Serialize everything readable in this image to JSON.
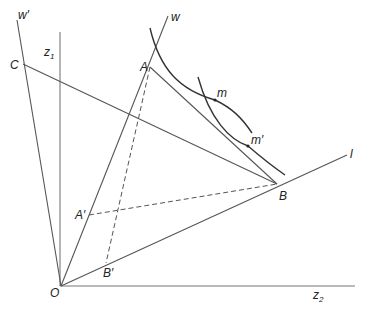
{
  "figure": {
    "type": "geometric diagram",
    "labels": {
      "w_prime": "w′",
      "z1": "z",
      "z1_sub": "1",
      "C": "C",
      "w": "w",
      "A": "A",
      "m": "m",
      "m_prime": "m′",
      "l": "l",
      "B": "B",
      "A_prime": "A′",
      "B_prime": "B′",
      "O": "O",
      "z2": "z",
      "z2_sub": "2"
    },
    "points": {
      "O": [
        61,
        286
      ],
      "A": [
        150,
        67
      ],
      "B": [
        277,
        184
      ],
      "C": [
        23,
        64
      ],
      "A_prime": [
        89,
        215
      ],
      "B_prime": [
        106,
        263
      ],
      "m": [
        215,
        100
      ],
      "m_prime": [
        248,
        146
      ]
    },
    "lines": [
      "O-w",
      "O-w'",
      "O-l",
      "O-z1 (vertical axis)",
      "O-z2 (horizontal axis)",
      "C-B",
      "A-B",
      "A'-B (dashed)",
      "A-B' (dashed)"
    ],
    "curves": [
      "indifference curve through m",
      "indifference curve through m'"
    ]
  }
}
